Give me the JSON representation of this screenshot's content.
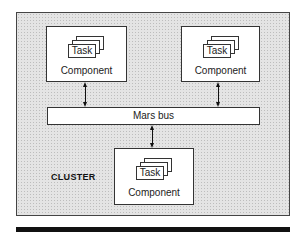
{
  "diagram": {
    "cluster_label": "CLUSTER",
    "bus_label": "Mars bus",
    "components": [
      {
        "label": "Component",
        "task_label": "Task",
        "position": "top-left"
      },
      {
        "label": "Component",
        "task_label": "Task",
        "position": "top-right"
      },
      {
        "label": "Component",
        "task_label": "Task",
        "position": "bottom-center"
      }
    ],
    "connections": [
      {
        "from": "components.0",
        "to": "bus",
        "type": "bidirectional"
      },
      {
        "from": "components.1",
        "to": "bus",
        "type": "bidirectional"
      },
      {
        "from": "bus",
        "to": "components.2",
        "type": "bidirectional"
      }
    ],
    "colors": {
      "cluster_fill": "#e4e4e4",
      "box_fill": "#ffffff",
      "stroke": "#333333",
      "rule": "#111111"
    }
  }
}
